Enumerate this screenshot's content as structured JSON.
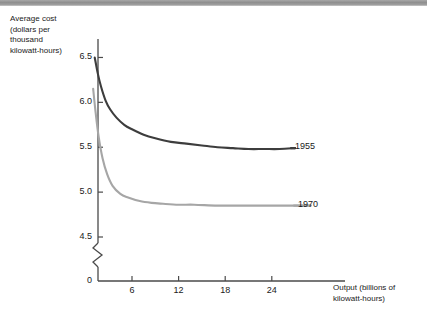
{
  "top_band": {
    "name": "page-edge-band",
    "color": "#979797"
  },
  "chart_data": {
    "type": "line",
    "title": "",
    "xlabel": "Output (billions of\nkilowatt-hours)",
    "ylabel": "Average cost\n(dollars per\nthousand\nkilowatt-hours)",
    "xlim": [
      0,
      33
    ],
    "ylim": [
      4.35,
      6.65
    ],
    "grid": false,
    "legend_position": "right-of-curve-ends",
    "y_axis_break": {
      "between": [
        4.5,
        0
      ],
      "symbol": "zigzag"
    },
    "yticks": [
      6.5,
      6.0,
      5.5,
      5.0,
      4.5,
      0
    ],
    "ytick_labels": [
      "6.5",
      "6.0",
      "5.5",
      "5.0",
      "4.5",
      "0"
    ],
    "xticks": [
      6,
      12,
      18,
      24
    ],
    "xtick_labels": [
      "6",
      "12",
      "18",
      "24"
    ],
    "series": [
      {
        "name": "1955",
        "color": "#3d3d3d",
        "label": "1955",
        "x": [
          1.2,
          1.6,
          2.0,
          2.6,
          3.2,
          4.0,
          5.0,
          6.0,
          7.5,
          9.0,
          11.0,
          13.0,
          15.0,
          17.0,
          19.0,
          21.0,
          23.0,
          25.0,
          27.0
        ],
        "y": [
          6.5,
          6.32,
          6.18,
          6.02,
          5.92,
          5.83,
          5.75,
          5.7,
          5.64,
          5.6,
          5.56,
          5.54,
          5.52,
          5.5,
          5.49,
          5.48,
          5.48,
          5.48,
          5.49
        ]
      },
      {
        "name": "1970",
        "color": "#a6a6a6",
        "label": "1970",
        "x": [
          1.0,
          1.3,
          1.7,
          2.2,
          2.8,
          3.5,
          4.5,
          5.5,
          7.0,
          8.5,
          10.0,
          12.0,
          14.0,
          17.0,
          20.0,
          23.0,
          26.0,
          29.0
        ],
        "y": [
          6.15,
          5.9,
          5.62,
          5.38,
          5.2,
          5.07,
          4.98,
          4.94,
          4.9,
          4.88,
          4.87,
          4.86,
          4.86,
          4.85,
          4.85,
          4.85,
          4.85,
          4.85
        ]
      }
    ]
  }
}
